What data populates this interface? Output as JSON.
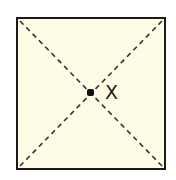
{
  "diagram": {
    "shape": "square",
    "fill_color": "#fefce6",
    "border_color": "#1a1a1a",
    "diagonals": "dashed",
    "center_point": {
      "label": "X"
    }
  }
}
